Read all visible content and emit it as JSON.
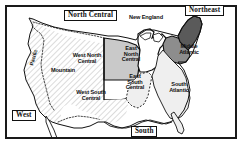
{
  "figure": {
    "kind": "map",
    "frame": {
      "border_color": "#1a1a1a",
      "background": "#ffffff"
    }
  },
  "colors": {
    "outline": "#111111",
    "hatch_fill": "#ffffff",
    "hatch_stroke": "#9a9a9a",
    "light_gray": "#c9c9c9",
    "medium_gray": "#8d8d8d",
    "dark_gray": "#5a5a5a",
    "very_light": "#efefef",
    "label_text": "#111111",
    "box_border": "#111111"
  },
  "region_labels": [
    {
      "id": "west",
      "text": "West",
      "style": "boxed",
      "x": 12,
      "y": 112
    },
    {
      "id": "north-central",
      "text": "North Central",
      "style": "boxed",
      "x": 69,
      "y": 12
    },
    {
      "id": "northeast",
      "text": "Northeast",
      "style": "boxed",
      "x": 189,
      "y": 8
    },
    {
      "id": "south",
      "text": "South",
      "style": "boxed",
      "x": 133,
      "y": 128
    }
  ],
  "division_labels": [
    {
      "id": "pacific",
      "text": "Pacific",
      "x": 27,
      "y": 58,
      "rotated": true
    },
    {
      "id": "mountain",
      "text": "Mountain",
      "x": 52,
      "y": 70,
      "rotated": false
    },
    {
      "id": "west-north-central",
      "text": "West North\nCentral",
      "x": 84,
      "y": 56,
      "rotated": false
    },
    {
      "id": "east-north-central",
      "text": "East\nNorth\nCentral",
      "x": 131,
      "y": 51,
      "rotated": false
    },
    {
      "id": "west-south-central",
      "text": "West South\nCentral",
      "x": 89,
      "y": 92,
      "rotated": false
    },
    {
      "id": "east-south-central",
      "text": "East\nSouth\nCentral",
      "x": 134,
      "y": 77,
      "rotated": false
    },
    {
      "id": "new-england",
      "text": "New England",
      "x": 146,
      "y": 17,
      "rotated": false
    },
    {
      "id": "middle-atlantic",
      "text": "Middle\nAtlantic",
      "x": 188,
      "y": 47,
      "rotated": false
    },
    {
      "id": "south-atlantic",
      "text": "South\nAtlantic",
      "x": 178,
      "y": 84,
      "rotated": false
    }
  ],
  "shading_legend": {
    "west_region": "diagonal-hatch",
    "west_north_central": "light-gray",
    "east_north_central": "white",
    "middle_atlantic": "medium-gray",
    "new_england": "dark-gray",
    "south_divisions": "very-light"
  }
}
